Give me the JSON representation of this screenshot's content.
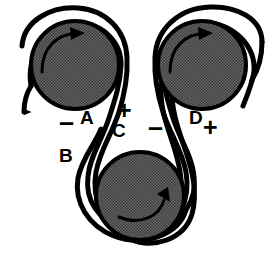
{
  "figure": {
    "background_color": "#ffffff",
    "ink_color": "#000000",
    "pulley_fill_color": "#4d4d4d",
    "pulley_outline_color": "#000000",
    "belt_color": "#000000"
  },
  "pulleys": [
    {
      "id": "pulley-top-left",
      "name": "top-left-pulley",
      "cx": 75,
      "cy": 65,
      "r": 44,
      "rotation": "clockwise",
      "arrow_label": "clockwise-rotation-arrow"
    },
    {
      "id": "pulley-top-right",
      "name": "top-right-pulley",
      "cx": 202,
      "cy": 65,
      "r": 44,
      "rotation": "clockwise",
      "arrow_label": "clockwise-rotation-arrow"
    },
    {
      "id": "pulley-bottom",
      "name": "bottom-pulley",
      "cx": 140,
      "cy": 196,
      "r": 44,
      "rotation": "counterclockwise",
      "arrow_label": "counterclockwise-rotation-arrow"
    }
  ],
  "belts": [
    {
      "id": "belt-left",
      "name": "left-belt",
      "free_end": "arrowhead-up",
      "note": "wraps top-left pulley, runs down to bottom pulley"
    },
    {
      "id": "belt-right",
      "name": "right-belt",
      "free_end": "open-ends",
      "note": "wraps top-right pulley, runs down to bottom pulley"
    }
  ],
  "labels": [
    {
      "id": "label-minus-a",
      "name": "label-minus-sign-a",
      "text": "–",
      "x": 59,
      "y": 111,
      "kind": "sign-minus"
    },
    {
      "id": "label-a",
      "name": "label-segment-a",
      "text": "A",
      "x": 80,
      "y": 108,
      "kind": "letter"
    },
    {
      "id": "label-plus-c",
      "name": "label-plus-sign-c",
      "text": "+",
      "x": 117,
      "y": 100,
      "kind": "sign"
    },
    {
      "id": "label-c",
      "name": "label-segment-c",
      "text": "C",
      "x": 112,
      "y": 121,
      "kind": "letter"
    },
    {
      "id": "label-minus-d",
      "name": "label-minus-sign-d",
      "text": "–",
      "x": 148,
      "y": 116,
      "kind": "sign-minus"
    },
    {
      "id": "label-d",
      "name": "label-segment-d",
      "text": "D",
      "x": 189,
      "y": 108,
      "kind": "letter"
    },
    {
      "id": "label-plus-d",
      "name": "label-plus-sign-d",
      "text": "+",
      "x": 203,
      "y": 117,
      "kind": "sign"
    },
    {
      "id": "label-b",
      "name": "label-segment-b",
      "text": "B",
      "x": 59,
      "y": 146,
      "kind": "letter"
    }
  ]
}
